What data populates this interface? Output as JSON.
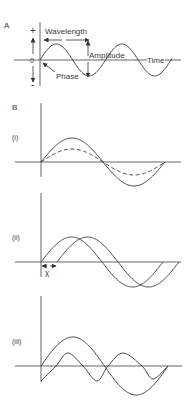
{
  "figure": {
    "panel_a": {
      "label": "A",
      "plus_sign": "+",
      "zero_label": "0",
      "minus_sign": "-",
      "annotations": {
        "wavelength": "Wavelength",
        "amplitude": "Amplitude",
        "phase": "Phase",
        "time": "Time"
      },
      "wave": {
        "x0": 40,
        "y0": 60,
        "amplitude": 16,
        "period": 65.5,
        "x_end": 172,
        "style": "solid"
      }
    },
    "panel_b": {
      "label": "B",
      "subpanels": [
        {
          "label": "(i)",
          "description": "Two waves, same phase and frequency, different amplitudes",
          "waves": [
            {
              "x0": 41,
              "y0": 162,
              "amplitude": 24,
              "period": 124,
              "x_end": 165,
              "style": "solid"
            },
            {
              "x0": 41,
              "y0": 162,
              "amplitude": 13,
              "period": 124,
              "x_end": 165,
              "style": "dashed"
            }
          ]
        },
        {
          "label": "(ii)",
          "phase_shift_label": "χ",
          "description": "Two waves, same amplitude and frequency, phase-shifted by χ",
          "waves": [
            {
              "x0": 41,
              "y0": 262,
              "amplitude": 25,
              "period": 122,
              "x_end": 163,
              "style": "solid"
            },
            {
              "x0": 57,
              "y0": 262,
              "amplitude": 25,
              "period": 122,
              "x_end": 179,
              "style": "solid"
            }
          ]
        },
        {
          "label": "(iii)",
          "description": "Two waves, different frequencies",
          "waves": [
            {
              "x0": 41,
              "y0": 366,
              "amplitude": 29,
              "period": 127,
              "x_end": 168,
              "style": "solid"
            },
            {
              "points": [
                [
                  41,
                  381
                ],
                [
                  56,
                  366
                ],
                [
                  68,
                  353
                ],
                [
                  83,
                  366
                ],
                [
                  97,
                  381
                ],
                [
                  108,
                  366
                ],
                [
                  123,
                  353
                ],
                [
                  142,
                  366
                ],
                [
                  153,
                  379
                ],
                [
                  168,
                  366
                ]
              ],
              "style": "solid"
            }
          ]
        }
      ]
    }
  }
}
